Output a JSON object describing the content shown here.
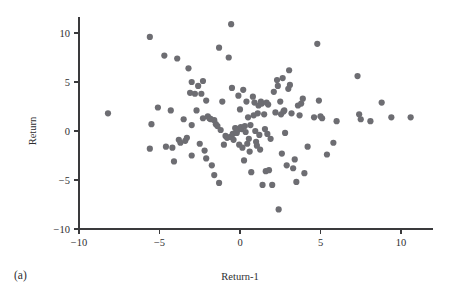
{
  "figure": {
    "panel_label": "(a)",
    "background_color": "#ffffff",
    "axis_color": "#3a3a3c",
    "point_color": "#6d6d72"
  },
  "chart_data": {
    "type": "scatter",
    "title": "",
    "xlabel": "Return-1",
    "ylabel": "Return",
    "xlim": [
      -11.5,
      12.0
    ],
    "ylim": [
      -10.5,
      11.6
    ],
    "xticks": [
      -10,
      -5,
      0,
      5,
      10
    ],
    "yticks": [
      -10,
      -5,
      0,
      5,
      10
    ],
    "xtick_labels": [
      "−10",
      "−5",
      "0",
      "5",
      "10"
    ],
    "ytick_labels": [
      "−10",
      "−5",
      "0",
      "5",
      "10"
    ],
    "grid": false,
    "legend": null,
    "marker": "circle",
    "marker_size": 3.1,
    "series": [
      {
        "name": "Return vs Return-1",
        "color": "#6d6d72",
        "points": [
          [
            -8.2,
            1.8
          ],
          [
            -5.6,
            9.6
          ],
          [
            -5.5,
            0.7
          ],
          [
            -5.6,
            -1.8
          ],
          [
            -5.1,
            2.4
          ],
          [
            -4.7,
            7.7
          ],
          [
            -4.6,
            -1.6
          ],
          [
            -4.3,
            2.1
          ],
          [
            -4.2,
            -1.7
          ],
          [
            -4.1,
            -3.1
          ],
          [
            -3.9,
            7.4
          ],
          [
            -3.8,
            -0.9
          ],
          [
            -3.7,
            -1.2
          ],
          [
            -3.5,
            1.2
          ],
          [
            -3.4,
            -1.0
          ],
          [
            -3.3,
            -0.7
          ],
          [
            -3.2,
            6.4
          ],
          [
            -3.1,
            3.9
          ],
          [
            -3.0,
            5.0
          ],
          [
            -3.0,
            0.6
          ],
          [
            -3.0,
            -2.5
          ],
          [
            -2.8,
            3.8
          ],
          [
            -2.7,
            2.1
          ],
          [
            -2.6,
            4.6
          ],
          [
            -2.5,
            -1.3
          ],
          [
            -2.4,
            3.8
          ],
          [
            -2.3,
            5.1
          ],
          [
            -2.3,
            1.3
          ],
          [
            -2.2,
            -2.0
          ],
          [
            -2.1,
            3.1
          ],
          [
            -2.1,
            -2.8
          ],
          [
            -2.0,
            1.5
          ],
          [
            -1.9,
            1.3
          ],
          [
            -1.85,
            1.25
          ],
          [
            -1.8,
            1.2
          ],
          [
            -1.75,
            -3.5
          ],
          [
            -1.6,
            1.1
          ],
          [
            -1.6,
            -4.5
          ],
          [
            -1.5,
            0.7
          ],
          [
            -1.4,
            0.5
          ],
          [
            -1.3,
            8.5
          ],
          [
            -1.3,
            -5.3
          ],
          [
            -1.2,
            0.1
          ],
          [
            -1.1,
            3.0
          ],
          [
            -1.0,
            -1.4
          ],
          [
            -0.9,
            -0.5
          ],
          [
            -0.8,
            -0.7
          ],
          [
            -0.7,
            7.5
          ],
          [
            -0.6,
            -0.6
          ],
          [
            -0.55,
            10.9
          ],
          [
            -0.5,
            4.4
          ],
          [
            -0.45,
            -0.3
          ],
          [
            -0.4,
            -0.9
          ],
          [
            -0.3,
            0.3
          ],
          [
            -0.25,
            0.25
          ],
          [
            -0.2,
            -0.2
          ],
          [
            -0.15,
            0.1
          ],
          [
            -0.1,
            3.6
          ],
          [
            -0.05,
            -1.4
          ],
          [
            0.0,
            2.2
          ],
          [
            0.05,
            0.4
          ],
          [
            0.1,
            0.2
          ],
          [
            0.15,
            -1.7
          ],
          [
            0.2,
            4.2
          ],
          [
            0.25,
            -3.0
          ],
          [
            0.3,
            0.5
          ],
          [
            0.35,
            -0.1
          ],
          [
            0.4,
            3.0
          ],
          [
            0.45,
            -1.3
          ],
          [
            0.5,
            1.4
          ],
          [
            0.55,
            -0.8
          ],
          [
            0.6,
            -2.1
          ],
          [
            0.65,
            0.6
          ],
          [
            0.7,
            -4.2
          ],
          [
            0.8,
            3.5
          ],
          [
            0.85,
            1.6
          ],
          [
            0.9,
            2.9
          ],
          [
            0.95,
            0.0
          ],
          [
            1.0,
            -1.1
          ],
          [
            1.05,
            -1.5
          ],
          [
            1.1,
            1.8
          ],
          [
            1.15,
            2.6
          ],
          [
            1.2,
            -0.4
          ],
          [
            1.25,
            -1.9
          ],
          [
            1.3,
            3.0
          ],
          [
            1.35,
            2.8
          ],
          [
            1.4,
            -5.5
          ],
          [
            1.5,
            1.7
          ],
          [
            1.55,
            0.2
          ],
          [
            1.6,
            -4.1
          ],
          [
            1.65,
            2.9
          ],
          [
            1.7,
            -0.3
          ],
          [
            1.75,
            2.7
          ],
          [
            1.8,
            -4.0
          ],
          [
            1.9,
            -0.8
          ],
          [
            2.0,
            -5.5
          ],
          [
            2.1,
            4.0
          ],
          [
            2.2,
            1.9
          ],
          [
            2.3,
            5.2
          ],
          [
            2.35,
            4.6
          ],
          [
            2.4,
            -8.0
          ],
          [
            2.5,
            3.0
          ],
          [
            2.55,
            1.7
          ],
          [
            2.6,
            -2.3
          ],
          [
            2.65,
            5.4
          ],
          [
            2.7,
            2.0
          ],
          [
            2.75,
            2.1
          ],
          [
            2.8,
            -0.2
          ],
          [
            2.9,
            -3.5
          ],
          [
            3.0,
            4.3
          ],
          [
            3.05,
            6.2
          ],
          [
            3.1,
            4.7
          ],
          [
            3.2,
            1.8
          ],
          [
            3.3,
            -3.8
          ],
          [
            3.4,
            -2.9
          ],
          [
            3.5,
            -5.2
          ],
          [
            3.6,
            2.6
          ],
          [
            3.7,
            1.6
          ],
          [
            3.8,
            2.8
          ],
          [
            3.9,
            3.3
          ],
          [
            4.0,
            -4.3
          ],
          [
            4.2,
            -1.6
          ],
          [
            4.6,
            1.4
          ],
          [
            4.8,
            8.9
          ],
          [
            4.9,
            3.1
          ],
          [
            5.0,
            1.5
          ],
          [
            5.1,
            1.3
          ],
          [
            5.4,
            -2.4
          ],
          [
            5.8,
            -1.2
          ],
          [
            6.0,
            1.0
          ],
          [
            7.3,
            5.6
          ],
          [
            7.4,
            1.7
          ],
          [
            7.5,
            1.2
          ],
          [
            8.1,
            1.0
          ],
          [
            8.8,
            2.9
          ],
          [
            9.4,
            1.4
          ],
          [
            10.6,
            1.4
          ]
        ]
      }
    ]
  }
}
